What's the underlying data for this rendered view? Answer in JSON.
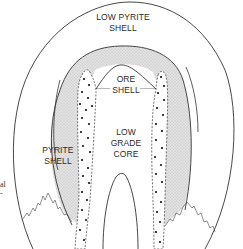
{
  "diagram": {
    "type": "porphyry alteration zoning cross-section",
    "labels": {
      "low_pyrite_shell": [
        "LOW PYRITE",
        "SHELL"
      ],
      "ore_shell": [
        "ORE",
        "SHELL"
      ],
      "low_grade_core": [
        "LOW",
        "GRADE",
        "CORE"
      ],
      "pyrite_shell": [
        "PYRITE",
        "SHELL"
      ]
    },
    "left_cut_text": [
      "al",
      "-"
    ],
    "colors": {
      "line": "#333333",
      "stipple_fill": "#dcdcdc",
      "background": "#ffffff",
      "dots": "#111111"
    }
  }
}
